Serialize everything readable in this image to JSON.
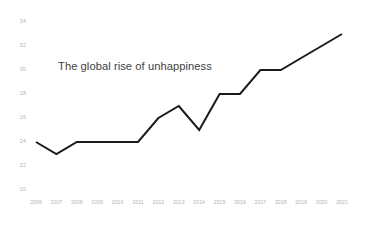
{
  "chart_data": {
    "type": "line",
    "title": "The global rise of unhappiness",
    "xlabel": "",
    "ylabel": "",
    "categories": [
      "2006",
      "2007",
      "2008",
      "2009",
      "2010",
      "2011",
      "2012",
      "2013",
      "2014",
      "2015",
      "2016",
      "2017",
      "2018",
      "2019",
      "2020",
      "2021"
    ],
    "values": [
      24,
      23,
      24,
      24,
      24,
      24,
      26,
      27,
      25,
      28,
      28,
      30,
      30,
      31,
      32,
      33
    ],
    "series": [
      {
        "name": "unhappiness",
        "values": [
          24,
          23,
          24,
          24,
          24,
          24,
          26,
          27,
          25,
          28,
          28,
          30,
          30,
          31,
          32,
          33
        ]
      }
    ],
    "ylim": [
      20,
      34
    ],
    "yticks": [
      20,
      22,
      24,
      26,
      28,
      30,
      32,
      34
    ],
    "ytick_labels": [
      "20",
      "22",
      "24",
      "26",
      "28",
      "30",
      "32",
      "34"
    ],
    "xtick_labels": [
      "2006",
      "2007",
      "2008",
      "2009",
      "2010",
      "2011",
      "2012",
      "2013",
      "2014",
      "2015",
      "2016",
      "2017",
      "2018",
      "2019",
      "2020",
      "2021"
    ],
    "grid": false,
    "legend": false,
    "markers": false,
    "line_color": "#1a1a1a",
    "line_width": 2,
    "tick_label_color": "#b4b4b4",
    "title_color": "#3f3f3f",
    "background_color": "#ffffff"
  }
}
